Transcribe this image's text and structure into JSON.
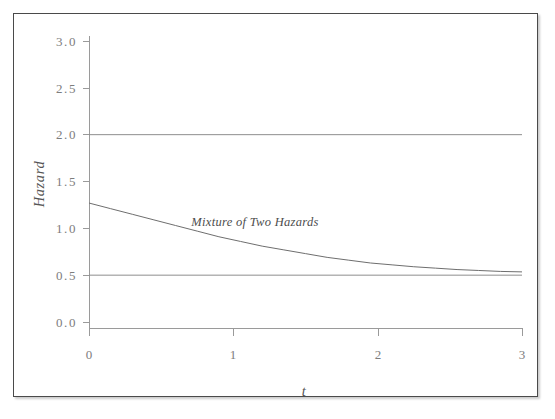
{
  "figure": {
    "background_color": "#ffffff",
    "frame_border_color": "#4a4a4a"
  },
  "chart_data": {
    "type": "line",
    "title": "",
    "subtitle": "",
    "xlabel": "t",
    "ylabel": "Hazard",
    "xlim": [
      0,
      3
    ],
    "ylim": [
      0.0,
      3.0
    ],
    "grid": false,
    "legend_position": "none",
    "x_ticks": [
      "0",
      "1",
      "2",
      "3"
    ],
    "x_tick_values": [
      0,
      1,
      2,
      3
    ],
    "y_ticks": [
      "0.0",
      "0.5",
      "1.0",
      "1.5",
      "2.0",
      "2.5",
      "3.0"
    ],
    "y_tick_values": [
      0.0,
      0.5,
      1.0,
      1.5,
      2.0,
      2.5,
      3.0
    ],
    "annotations": [
      {
        "text": "Mixture of Two Hazards",
        "x": 1.15,
        "y": 1.02,
        "style": "italic"
      }
    ],
    "series": [
      {
        "name": "Hazard 1 (constant)",
        "color": "#8e8e8e",
        "x": [
          0,
          3
        ],
        "values": [
          2.0,
          2.0
        ]
      },
      {
        "name": "Hazard 2 (constant)",
        "color": "#8e8e8e",
        "x": [
          0,
          3
        ],
        "values": [
          0.5,
          0.5
        ]
      },
      {
        "name": "Mixture of Two Hazards",
        "color": "#6e6e6e",
        "x": [
          0.0,
          0.15,
          0.3,
          0.45,
          0.6,
          0.75,
          0.9,
          1.05,
          1.2,
          1.35,
          1.5,
          1.65,
          1.8,
          1.95,
          2.1,
          2.25,
          2.4,
          2.55,
          2.7,
          2.85,
          3.0
        ],
        "values": [
          1.27,
          1.21,
          1.15,
          1.09,
          1.03,
          0.97,
          0.91,
          0.86,
          0.81,
          0.77,
          0.73,
          0.69,
          0.66,
          0.63,
          0.61,
          0.59,
          0.575,
          0.56,
          0.55,
          0.54,
          0.535
        ]
      }
    ]
  },
  "labels": {
    "y_axis_title": "Hazard",
    "x_axis_title": "t",
    "annotation": "Mixture of Two Hazards",
    "y_tick_0": "0.0",
    "y_tick_1": "0.5",
    "y_tick_2": "1.0",
    "y_tick_3": "1.5",
    "y_tick_4": "2.0",
    "y_tick_5": "2.5",
    "y_tick_6": "3.0",
    "x_tick_0": "0",
    "x_tick_1": "1",
    "x_tick_2": "2",
    "x_tick_3": "3"
  }
}
